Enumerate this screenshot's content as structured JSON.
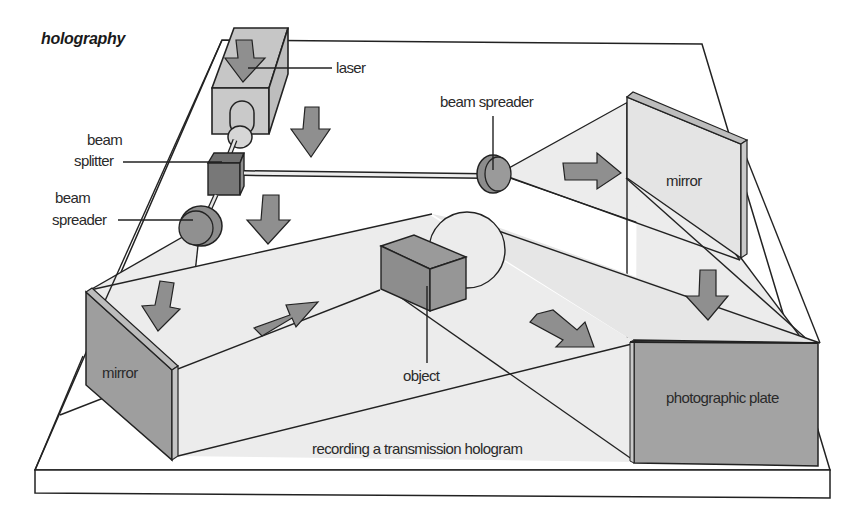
{
  "diagram": {
    "title": "holography",
    "caption": "recording a transmission hologram",
    "labels": {
      "laser": "laser",
      "beam_splitter_line1": "beam",
      "beam_splitter_line2": "splitter",
      "beam_spreader_left_line1": "beam",
      "beam_spreader_left_line2": "spreader",
      "beam_spreader_right": "beam spreader",
      "mirror_right": "mirror",
      "mirror_left": "mirror",
      "object": "object",
      "photographic_plate": "photographic plate"
    },
    "components": [
      "laser",
      "beam splitter",
      "beam spreader (left)",
      "beam spreader (right)",
      "mirror (left)",
      "mirror (right)",
      "object",
      "photographic plate"
    ],
    "colors": {
      "background": "#ffffff",
      "table_top": "#ffffff",
      "light_beam": "#ececec",
      "component_dark": "#8a8a8a",
      "component_mid": "#a6a6a6",
      "component_light": "#c9c9c9",
      "arrow": "#8f8f8f",
      "outline": "#222222"
    }
  }
}
